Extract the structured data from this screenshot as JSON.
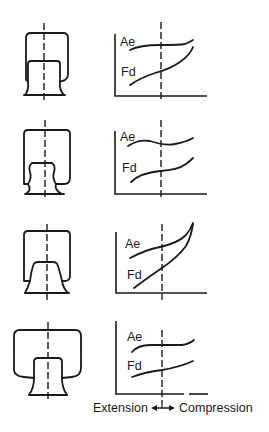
{
  "figure": {
    "rows": [
      {
        "id": "row-1",
        "shape": "straight-piston-bellows",
        "curve_labels": {
          "upper": "Ae",
          "lower": "Fd"
        }
      },
      {
        "id": "row-2",
        "shape": "bulbous-piston-bellows",
        "curve_labels": {
          "upper": "Ae",
          "lower": "Fd"
        }
      },
      {
        "id": "row-3",
        "shape": "tapered-piston-bellows",
        "curve_labels": {
          "upper": "Ae",
          "lower": "Fd"
        }
      },
      {
        "id": "row-4",
        "shape": "wide-bellows-narrow-piston",
        "curve_labels": {
          "upper": "Ae",
          "lower": "Fd"
        }
      }
    ],
    "x_axis_caption": {
      "left": "Extension",
      "right": "Compression",
      "arrow": "double-arrow-icon"
    }
  }
}
